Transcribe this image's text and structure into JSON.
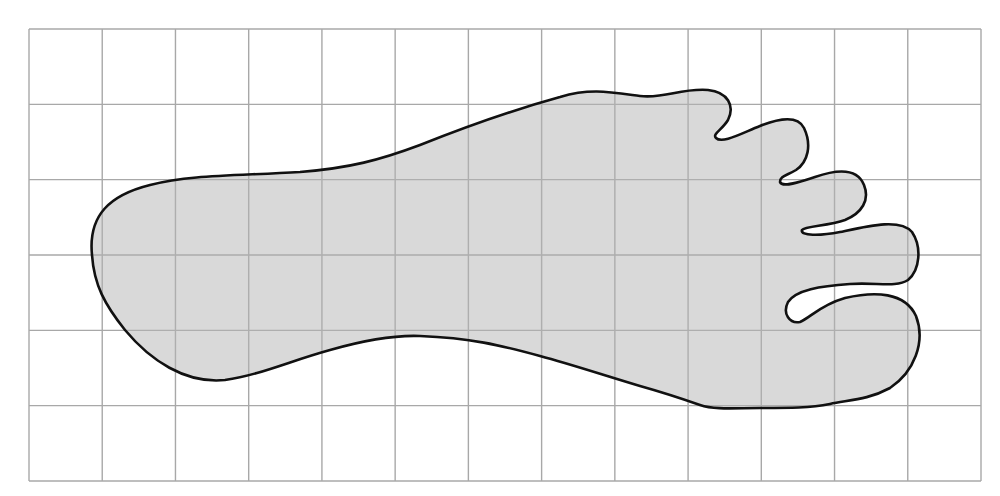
{
  "figure": {
    "type": "footprint-on-grid",
    "grid": {
      "x0": 29,
      "y0": 29,
      "x1": 981,
      "y1": 481,
      "columns": 13,
      "rows": 6,
      "line_color": "#a8a8a8",
      "background": "#ffffff"
    },
    "foot": {
      "fill": "#d9d9d9",
      "stroke": "#111111",
      "stroke_width": 2.6,
      "toe_count": 5,
      "path": "M 92 255 C 88 215 110 195 150 185 C 190 175 230 176 300 172 C 350 168 380 160 420 145 C 470 125 520 108 560 97 C 590 88 610 92 640 96 C 665 99 680 88 708 90 C 728 92 735 106 728 120 C 722 130 712 134 716 138 C 722 144 740 134 760 126 C 780 118 798 116 804 128 C 812 145 808 162 796 170 C 786 176 780 176 780 182 C 782 188 800 182 815 177 C 835 170 857 167 864 185 C 870 200 862 213 845 220 C 828 226 805 226 802 230 C 800 236 820 236 840 232 C 868 226 900 218 912 232 C 922 247 920 270 908 280 C 896 288 876 282 850 284 C 820 286 796 290 788 302 C 782 314 790 324 800 322 C 810 318 820 305 845 298 C 875 291 905 292 916 316 C 926 342 914 372 890 388 C 868 400 848 400 830 404 C 810 408 790 408 760 408 C 735 408 715 410 700 405 C 680 398 665 393 640 386 C 600 374 570 364 540 356 C 500 345 470 338 420 336 C 395 335 365 340 330 350 C 290 361 260 375 225 380 C 185 384 150 360 125 330 C 105 305 94 285 92 255 Z"
    }
  },
  "icons": {
    "foot": "footprint-icon"
  }
}
